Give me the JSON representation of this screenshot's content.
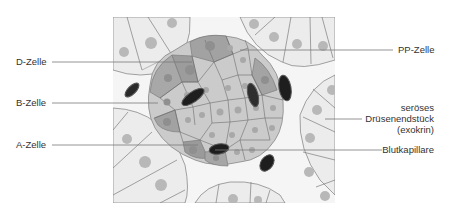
{
  "labels": {
    "d_cell": "D-Zelle",
    "b_cell": "B-Zelle",
    "a_cell": "A-Zelle",
    "pp_cell": "PP-Zelle",
    "serous_line1": "seröses",
    "serous_line2": "Drüsenendstück",
    "serous_line3": "(exokrin)",
    "capillary": "Blutkapillare"
  },
  "colors": {
    "background": "#ffffff",
    "panel": "#f4f4f4",
    "acinus_cell": "#ececec",
    "acinus_nucleus": "#b4b4b4",
    "islet_light_cell": "#c8c8c8",
    "islet_mid_cell": "#a6a6a6",
    "islet_dark_cell": "#8e8e8e",
    "capillary": "#222222",
    "line": "#7a7a7a",
    "text": "#333333"
  }
}
